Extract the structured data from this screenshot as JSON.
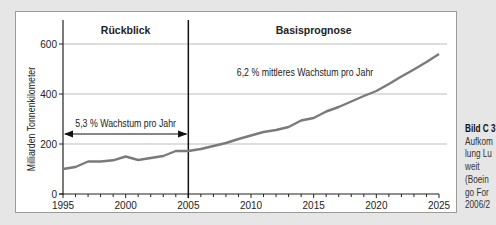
{
  "chart_data": {
    "type": "line",
    "title": "",
    "xlabel": "",
    "ylabel": "Milliarden Tonnenkilometer",
    "xlim": [
      1995,
      2025
    ],
    "ylim": [
      0,
      600
    ],
    "x_ticks": [
      1995,
      2000,
      2005,
      2010,
      2015,
      2020,
      2025
    ],
    "y_ticks": [
      0,
      200,
      400,
      600
    ],
    "grid": "horizontal",
    "series": [
      {
        "name": "Luftfracht weltweit",
        "x": [
          1995,
          1996,
          1997,
          1998,
          1999,
          2000,
          2001,
          2002,
          2003,
          2004,
          2005,
          2006,
          2007,
          2008,
          2009,
          2010,
          2011,
          2012,
          2013,
          2014,
          2015,
          2016,
          2017,
          2018,
          2019,
          2020,
          2021,
          2022,
          2023,
          2024,
          2025
        ],
        "values": [
          100,
          108,
          130,
          130,
          135,
          150,
          136,
          144,
          152,
          172,
          172,
          180,
          192,
          204,
          220,
          234,
          248,
          256,
          268,
          294,
          304,
          330,
          348,
          370,
          392,
          412,
          440,
          470,
          498,
          528,
          560
        ]
      }
    ],
    "divider_year": 2005,
    "sections": [
      {
        "label": "Rückblick",
        "from": 1995,
        "to": 2005
      },
      {
        "label": "Basisprognose",
        "from": 2005,
        "to": 2025
      }
    ],
    "annotations": [
      {
        "text": "5,3 % Wachstum pro Jahr",
        "type": "double-arrow",
        "from": 1995,
        "to": 2005
      },
      {
        "text": "6,2 % mittleres Wachstum pro Jahr",
        "type": "label"
      }
    ],
    "colors": {
      "line": "#7a7a7a",
      "grid": "#bdbdbd",
      "axis": "#222222"
    }
  },
  "caption": {
    "lines": [
      "Bild C 3",
      "Aufkom",
      "lung Lu",
      "weit",
      "(Boein",
      "go For",
      "2006/2"
    ]
  }
}
